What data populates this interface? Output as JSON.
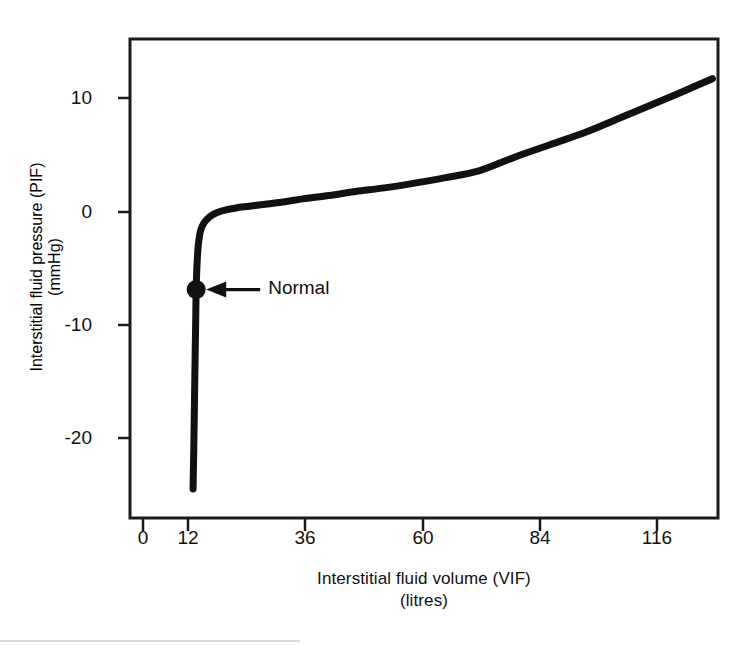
{
  "chart_data": {
    "type": "line",
    "title": "",
    "xlabel": "Interstitial fluid volume (VIF)",
    "xlabel_units": "(litres)",
    "ylabel": "Interstitial fluid pressure (PIF)",
    "ylabel_units": "(mmHg)",
    "xlim": [
      0,
      128.5
    ],
    "ylim": [
      -24.5,
      13.5
    ],
    "grid": false,
    "legend": "none",
    "xticks": [
      0,
      12,
      36,
      60,
      84,
      116
    ],
    "xtick_labels": [
      "0",
      "12",
      "36",
      "60",
      "84",
      "116"
    ],
    "yticks": [
      10,
      0,
      -10,
      -20
    ],
    "ytick_labels": [
      "10",
      "0",
      "-10",
      "-20"
    ],
    "series": [
      {
        "name": "Interstitial fluid pressure curve",
        "x": [
          11.3,
          11.5,
          11.7,
          11.9,
          12.0,
          12.2,
          12.5,
          13.0,
          13.8,
          15.0,
          16.5,
          18.5,
          21.0,
          24.0,
          28.0,
          32.0,
          36.0,
          42.0,
          48.0,
          54.0,
          60.0,
          68.0,
          76.0,
          84.0,
          92.0,
          100.0,
          108.0,
          116.0,
          122.0,
          128.5
        ],
        "y": [
          -24.5,
          -20.0,
          -14.5,
          -9.5,
          -6.9,
          -4.6,
          -2.9,
          -1.7,
          -1.0,
          -0.5,
          -0.15,
          0.1,
          0.3,
          0.45,
          0.65,
          0.85,
          1.1,
          1.4,
          1.75,
          2.05,
          2.4,
          2.95,
          3.6,
          4.8,
          5.9,
          7.0,
          8.3,
          9.6,
          10.6,
          11.7
        ]
      }
    ],
    "annotations": [
      {
        "name": "normal-point",
        "label": "Normal",
        "x": 12.0,
        "y": -6.9,
        "marker": "filled-circle",
        "arrow": "left-arrow"
      }
    ],
    "colors": {
      "curve": "#111111",
      "frame": "#1a1a1a",
      "text": "#111111",
      "background": "#ffffff"
    }
  },
  "axes": {
    "x_title_line1": "Interstitial fluid volume (VIF)",
    "x_title_line2": "(litres)",
    "y_title_line1": "Interstitial fluid pressure (PIF)",
    "y_title_line2": "(mmHg)"
  },
  "ticks": {
    "x": [
      {
        "label": "0",
        "px": 143
      },
      {
        "label": "12",
        "px": 188
      },
      {
        "label": "36",
        "px": 305
      },
      {
        "label": "60",
        "px": 423
      },
      {
        "label": "84",
        "px": 540
      },
      {
        "label": "116",
        "px": 657
      }
    ],
    "y": [
      {
        "label": "10",
        "px": 98
      },
      {
        "label": "0",
        "px": 212
      },
      {
        "label": "-10",
        "px": 325
      },
      {
        "label": "-20",
        "px": 438
      }
    ]
  },
  "annotation": {
    "normal_label": "Normal"
  }
}
